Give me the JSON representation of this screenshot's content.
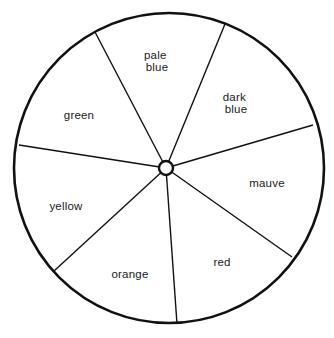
{
  "diagram": {
    "type": "color-wheel",
    "colors": {
      "background": "#ffffff",
      "stroke": "#111111",
      "text": "#1a1a1a"
    },
    "outer_circle": {
      "cx": 169,
      "cy": 168,
      "r": 155
    },
    "hub": {
      "cx": 166,
      "cy": 168,
      "r": 7
    },
    "spokes": [
      {
        "name": "spoke-green-paleblue",
        "x2": 95,
        "y2": 32
      },
      {
        "name": "spoke-paleblue-darkblue",
        "x2": 225,
        "y2": 24
      },
      {
        "name": "spoke-darkblue-mauve",
        "x2": 313,
        "y2": 125
      },
      {
        "name": "spoke-mauve-red",
        "x2": 292,
        "y2": 257
      },
      {
        "name": "spoke-red-orange",
        "x2": 177,
        "y2": 324
      },
      {
        "name": "spoke-orange-yellow",
        "x2": 54,
        "y2": 271
      },
      {
        "name": "spoke-yellow-green",
        "x2": 19,
        "y2": 145
      }
    ],
    "sectors": [
      {
        "id": "pale-blue",
        "lines": [
          "pale",
          "blue"
        ],
        "x": 157,
        "y": 61
      },
      {
        "id": "dark-blue",
        "lines": [
          "dark",
          "blue"
        ],
        "x": 236,
        "y": 103
      },
      {
        "id": "mauve",
        "lines": [
          "mauve"
        ],
        "x": 267,
        "y": 183
      },
      {
        "id": "red",
        "lines": [
          "red"
        ],
        "x": 222,
        "y": 262
      },
      {
        "id": "orange",
        "lines": [
          "orange"
        ],
        "x": 130,
        "y": 274
      },
      {
        "id": "yellow",
        "lines": [
          "yellow"
        ],
        "x": 66,
        "y": 206
      },
      {
        "id": "green",
        "lines": [
          "green"
        ],
        "x": 79,
        "y": 115
      }
    ]
  }
}
